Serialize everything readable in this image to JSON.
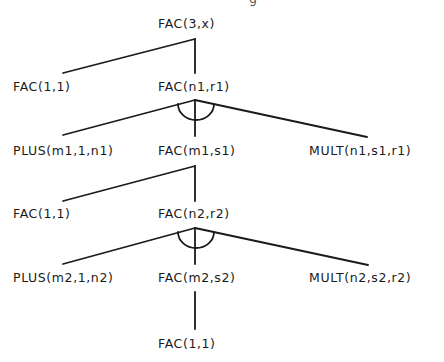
{
  "diagram": {
    "type": "and-or proof tree",
    "colors": {
      "background": "#ffffff",
      "ink": "#1a1a1a"
    },
    "nodes": {
      "root": "FAC(3,x)",
      "l1_base": "FAC(1,1)",
      "l1_rec": "FAC(n1,r1)",
      "l2_plus": "PLUS(m1,1,n1)",
      "l2_fac": "FAC(m1,s1)",
      "l2_mult": "MULT(n1,s1,r1)",
      "l3_base": "FAC(1,1)",
      "l3_rec": "FAC(n2,r2)",
      "l4_plus": "PLUS(m2,1,n2)",
      "l4_fac": "FAC(m2,s2)",
      "l4_mult": "MULT(n2,s2,r2)",
      "l5_base": "FAC(1,1)"
    },
    "edges": [
      {
        "from": "root",
        "to": "l1_base",
        "kind": "or"
      },
      {
        "from": "root",
        "to": "l1_rec",
        "kind": "or"
      },
      {
        "from": "l1_rec",
        "to": "l2_plus",
        "kind": "and"
      },
      {
        "from": "l1_rec",
        "to": "l2_fac",
        "kind": "and"
      },
      {
        "from": "l1_rec",
        "to": "l2_mult",
        "kind": "and"
      },
      {
        "from": "l2_fac",
        "to": "l3_base",
        "kind": "or"
      },
      {
        "from": "l2_fac",
        "to": "l3_rec",
        "kind": "or"
      },
      {
        "from": "l3_rec",
        "to": "l4_plus",
        "kind": "and"
      },
      {
        "from": "l3_rec",
        "to": "l4_fac",
        "kind": "and"
      },
      {
        "from": "l3_rec",
        "to": "l4_mult",
        "kind": "and"
      },
      {
        "from": "l4_fac",
        "to": "l5_base",
        "kind": "single"
      }
    ],
    "clipped_top_glyph": "g"
  }
}
